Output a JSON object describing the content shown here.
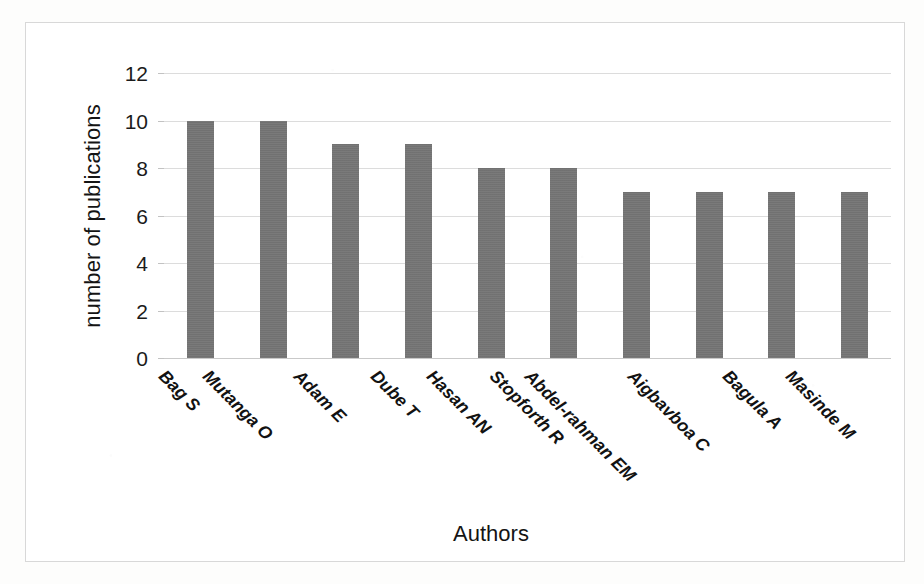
{
  "chart_data": {
    "type": "bar",
    "title": "",
    "xlabel": "Authors",
    "ylabel": "number of publications",
    "categories": [
      "Bag S",
      "Mutanga O",
      "Adam E",
      "Dube T",
      "Hasan AN",
      "Stopforth R",
      "Abdel-rahman EM",
      "Aigbavboa C",
      "Bagula A",
      "Masinde M"
    ],
    "values": [
      10,
      10,
      9,
      9,
      8,
      8,
      7,
      7,
      7,
      7
    ],
    "ylim": [
      0,
      12
    ],
    "yticks": [
      0,
      2,
      4,
      6,
      8,
      10,
      12
    ],
    "ytick_labels": [
      "0",
      "2",
      "4",
      "6",
      "8",
      "10",
      "12"
    ],
    "grid": true,
    "legend": false,
    "legend_position": "none",
    "series": [
      {
        "name": "number of publications",
        "values": [
          10,
          10,
          9,
          9,
          8,
          8,
          7,
          7,
          7,
          7
        ]
      }
    ]
  },
  "colors": {
    "bar": "#757575",
    "gridline": "#dcdcdc",
    "frame": "#d8d8d8",
    "text": "#141414",
    "background": "#ffffff"
  }
}
